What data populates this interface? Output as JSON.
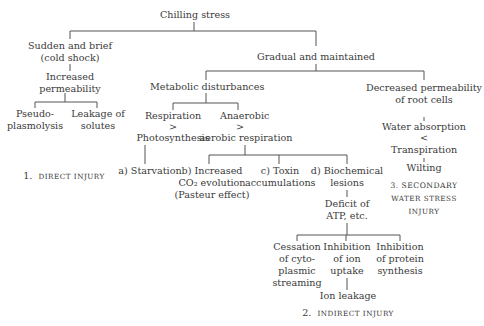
{
  "diagram": {
    "root": "Chilling stress",
    "sudden": {
      "line1": "Sudden and brief",
      "line2": "(cold shock)"
    },
    "increased_permeability": {
      "line1": "Increased",
      "line2": "permeability"
    },
    "pseudo": {
      "line1": "Pseudo-",
      "line2": "plasmolysis"
    },
    "leakage": {
      "line1": "Leakage of",
      "line2": "solutes"
    },
    "direct_injury": {
      "num": "1.",
      "label": "DIRECT INJURY"
    },
    "gradual": "Gradual and maintained",
    "metabolic": "Metabolic disturbances",
    "resp_photo": {
      "line1": "Respiration",
      "line2": ">",
      "line3": "Photosynthesis"
    },
    "anaerobic": {
      "line1": "Anaerobic",
      "line2": ">",
      "line3": "aerobic respiration"
    },
    "starvation": "a)  Starvation",
    "co2": {
      "line1": "b)  Increased",
      "line2": "CO₂ evolution",
      "line3": "(Pasteur effect)"
    },
    "toxin": {
      "line1": "c)  Toxin",
      "line2": "accumulations"
    },
    "biochem": {
      "line1": "d)  Biochemical",
      "line2": "lesions"
    },
    "atp": {
      "line1": "Deficit of",
      "line2": "ATP, etc."
    },
    "cessation": {
      "line1": "Cessation",
      "line2": "of cyto-",
      "line3": "plasmic",
      "line4": "streaming"
    },
    "ion_uptake": {
      "line1": "Inhibition",
      "line2": "of ion",
      "line3": "uptake"
    },
    "protein": {
      "line1": "Inhibition",
      "line2": "of protein",
      "line3": "synthesis"
    },
    "ion_leakage": "Ion leakage",
    "indirect_injury": {
      "num": "2.",
      "label": "INDIRECT INJURY"
    },
    "decreased_perm": {
      "line1": "Decreased permeability",
      "line2": "of root cells"
    },
    "water_abs": "Water absorption",
    "lt": "<",
    "transpiration": "Transpiration",
    "wilting": "Wilting",
    "secondary": {
      "line1": "3.  SECONDARY",
      "line2": "WATER STRESS",
      "line3": "INJURY"
    }
  }
}
